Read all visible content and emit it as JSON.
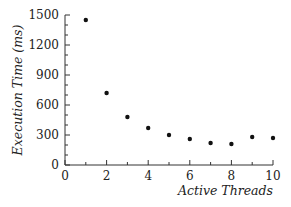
{
  "chart_data": {
    "type": "scatter",
    "title": "",
    "xlabel": "Active Threads",
    "ylabel": "Execution Time (ms)",
    "xlim": [
      0,
      10
    ],
    "ylim": [
      0,
      1500
    ],
    "x_ticks": [
      0,
      2,
      4,
      6,
      8,
      10
    ],
    "x_tick_labels": [
      "0",
      "2",
      "4",
      "6",
      "8",
      "10"
    ],
    "y_ticks": [
      0,
      300,
      600,
      900,
      1200,
      1500
    ],
    "y_tick_labels": [
      "0",
      "300",
      "600",
      "900",
      "1200",
      "1500"
    ],
    "grid": false,
    "legend": null,
    "series": [
      {
        "name": "Execution Time",
        "x": [
          1,
          2,
          3,
          4,
          5,
          6,
          7,
          8,
          9,
          10
        ],
        "y": [
          1450,
          720,
          480,
          370,
          300,
          260,
          220,
          210,
          280,
          270
        ],
        "color": "#111111"
      }
    ]
  }
}
